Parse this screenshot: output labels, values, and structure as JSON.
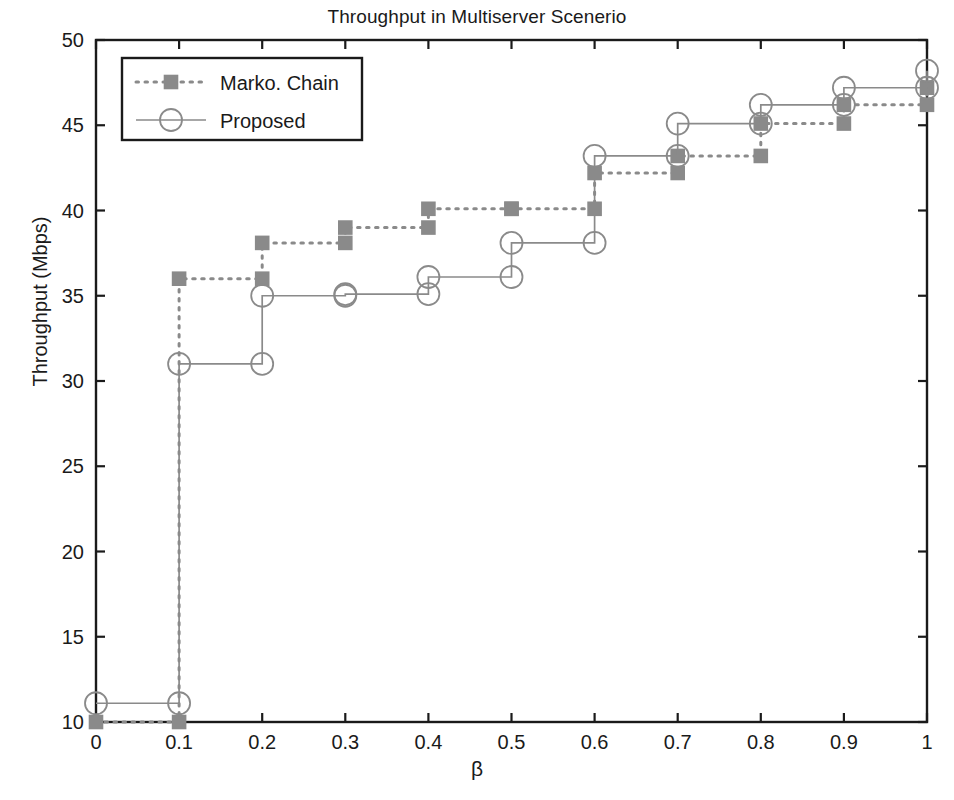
{
  "chart_data": {
    "type": "line",
    "title": "Throughput in Multiserver Scenerio",
    "xlabel": "β",
    "ylabel": "Throughput (Mbps)",
    "xlim": [
      0,
      1
    ],
    "ylim": [
      10,
      50
    ],
    "xticks": [
      "0",
      "0.1",
      "0.2",
      "0.3",
      "0.4",
      "0.5",
      "0.6",
      "0.7",
      "0.8",
      "0.9",
      "1"
    ],
    "xtick_values": [
      0,
      0.1,
      0.2,
      0.3,
      0.4,
      0.5,
      0.6,
      0.7,
      0.8,
      0.9,
      1
    ],
    "yticks": [
      "10",
      "15",
      "20",
      "25",
      "30",
      "35",
      "40",
      "45",
      "50"
    ],
    "ytick_values": [
      10,
      15,
      20,
      25,
      30,
      35,
      40,
      45,
      50
    ],
    "grid": false,
    "drawstyle": "steps-post",
    "legend_position": "upper left",
    "x": [
      0,
      0.1,
      0.2,
      0.3,
      0.4,
      0.5,
      0.6,
      0.7,
      0.8,
      0.9,
      1
    ],
    "series": [
      {
        "name": "Marko. Chain",
        "marker": "square",
        "linestyle": "dotted",
        "color": "#8a8a8a",
        "values": [
          10.0,
          36.0,
          38.1,
          39.0,
          40.1,
          40.1,
          42.2,
          43.2,
          45.1,
          46.2,
          47.2
        ]
      },
      {
        "name": "Proposed",
        "marker": "circle",
        "linestyle": "solid",
        "color": "#8a8a8a",
        "values": [
          11.1,
          31.0,
          35.0,
          35.1,
          36.1,
          38.1,
          43.2,
          45.1,
          46.2,
          47.2,
          48.2
        ]
      }
    ]
  },
  "legend": {
    "entries": [
      {
        "label": "Marko. Chain"
      },
      {
        "label": "Proposed"
      }
    ]
  },
  "colors": {
    "axis": "#1a1a1a",
    "series": "#8a8a8a",
    "background": "#ffffff"
  }
}
